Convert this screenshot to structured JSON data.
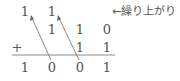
{
  "diagram": {
    "carry_label": "←繰り上がり",
    "operator": "+",
    "columns": 4,
    "rows": {
      "carries": [
        "1",
        "1",
        "",
        ""
      ],
      "operand_1": [
        "",
        "1",
        "1",
        "0"
      ],
      "operand_2": [
        "",
        "",
        "1",
        "1"
      ],
      "result": [
        "1",
        "0",
        "0",
        "1"
      ]
    },
    "arrows": [
      {
        "from_column": 1,
        "to_column": 0,
        "description": "carry from column 2 to column 1"
      },
      {
        "from_column": 2,
        "to_column": 1,
        "description": "carry from column 3 to column 2"
      }
    ],
    "colors": {
      "text": "#555555",
      "line": "#777777",
      "background": "#ffffff"
    }
  }
}
